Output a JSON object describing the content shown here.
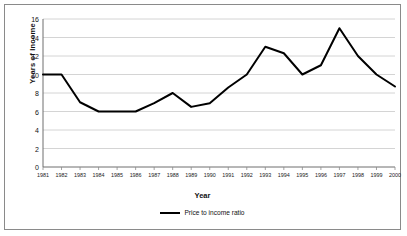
{
  "chart_data": {
    "type": "line",
    "title": "",
    "xlabel": "Year",
    "ylabel": "Years of Income",
    "xlim": [
      1981,
      2000
    ],
    "ylim": [
      0,
      16
    ],
    "ytick_step": 2,
    "grid": true,
    "legend_position": "bottom",
    "line_color": "#000000",
    "gridline_color": "#c9c9c9",
    "plot_background": "#ffffff",
    "categories": [
      "1981",
      "1982",
      "1983",
      "1984",
      "1985",
      "1986",
      "1987",
      "1988",
      "1989",
      "1990",
      "1991",
      "1992",
      "1993",
      "1994",
      "1995",
      "1996",
      "1997",
      "1998",
      "1999",
      "2000"
    ],
    "yticks": [
      "0",
      "2",
      "4",
      "6",
      "8",
      "10",
      "12",
      "14",
      "16"
    ],
    "series": [
      {
        "name": "Price to income ratio",
        "values": [
          10,
          10,
          7,
          6,
          6,
          6,
          6.9,
          8,
          6.5,
          6.9,
          8.6,
          10,
          13,
          12.3,
          10,
          11,
          15,
          12,
          10,
          8.7
        ]
      }
    ]
  },
  "legend": {
    "entries": [
      "Price to income ratio"
    ]
  }
}
